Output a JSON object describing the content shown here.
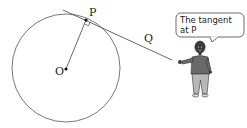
{
  "diagram": {
    "points": {
      "centre": {
        "label": "O",
        "x": 66,
        "y": 69
      },
      "tangent_point": {
        "label": "P",
        "x": 86,
        "y": 20
      },
      "line_point": {
        "label": "Q"
      }
    },
    "circle": {
      "cx": 66,
      "cy": 68,
      "r": 54
    },
    "right_angle_marker": true,
    "speech_bubble": {
      "line1": "The tangent",
      "line2": "at P"
    },
    "colors": {
      "stroke": "#333333",
      "shirt": "#6a6a6a",
      "trousers": "#b8b8b8",
      "skin": "#3a3a3a",
      "background": "#ffffff"
    }
  }
}
